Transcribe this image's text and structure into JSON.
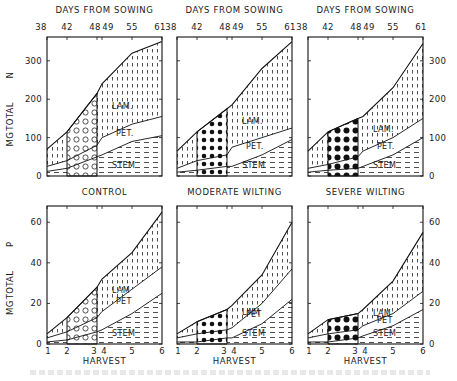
{
  "figure": {
    "top_axis_title": "DAYS FROM SOWING",
    "top_axis_ticks": [
      "38",
      "42",
      "48",
      "49",
      "55",
      "61"
    ],
    "bottom_axis_title": "HARVEST",
    "bottom_axis_ticks": [
      "1",
      "2",
      "3",
      "4",
      "5",
      "6"
    ],
    "top_ylabel": [
      "MG",
      "TOTAL",
      "N"
    ],
    "bottom_ylabel": [
      "MG",
      "TOTAL",
      "P"
    ],
    "top_yticks": [
      "0",
      "100",
      "200",
      "300"
    ],
    "bottom_yticks": [
      "0",
      "20",
      "40",
      "60"
    ],
    "panel_titles": [
      "CONTROL",
      "MODERATE WILTING",
      "SEVERE WILTING"
    ],
    "region_labels": {
      "lam": "LAM.",
      "pet": "PET.",
      "stem": "STEM",
      "lam_p": "LAM",
      "pet_p": "PET",
      "stem_p": "STEM"
    }
  },
  "chart_data": [
    {
      "type": "area",
      "title": "CONTROL",
      "xlabel": "DAYS FROM SOWING",
      "ylabel": "MG TOTAL N",
      "x": [
        38,
        42,
        48,
        49,
        55,
        61
      ],
      "ylim": [
        0,
        362
      ],
      "stacked": true,
      "series": [
        {
          "name": "STEM",
          "values": [
            12,
            20,
            50,
            55,
            90,
            105
          ]
        },
        {
          "name": "PET.",
          "values": [
            13,
            20,
            30,
            45,
            45,
            50
          ]
        },
        {
          "name": "LAM.",
          "values": [
            45,
            75,
            135,
            140,
            185,
            195
          ]
        }
      ],
      "cumulative_top": [
        70,
        115,
        215,
        240,
        320,
        350
      ],
      "highlight_interval": [
        42,
        48
      ]
    },
    {
      "type": "area",
      "title": "MODERATE WILTING",
      "xlabel": "DAYS FROM SOWING",
      "ylabel": "MG TOTAL N",
      "x": [
        38,
        42,
        48,
        49,
        55,
        61
      ],
      "ylim": [
        0,
        362
      ],
      "stacked": true,
      "series": [
        {
          "name": "STEM",
          "values": [
            10,
            15,
            25,
            25,
            55,
            95
          ]
        },
        {
          "name": "PET.",
          "values": [
            10,
            25,
            30,
            50,
            45,
            30
          ]
        },
        {
          "name": "LAM.",
          "values": [
            45,
            75,
            120,
            110,
            180,
            225
          ]
        }
      ],
      "cumulative_top": [
        65,
        115,
        175,
        185,
        280,
        350
      ],
      "highlight_interval": [
        42,
        48
      ]
    },
    {
      "type": "area",
      "title": "SEVERE WILTING",
      "xlabel": "DAYS FROM SOWING",
      "ylabel": "MG TOTAL N",
      "x": [
        38,
        42,
        48,
        49,
        55,
        61
      ],
      "ylim": [
        0,
        362
      ],
      "stacked": true,
      "series": [
        {
          "name": "STEM",
          "values": [
            10,
            15,
            20,
            25,
            55,
            100
          ]
        },
        {
          "name": "PET.",
          "values": [
            10,
            15,
            30,
            40,
            45,
            50
          ]
        },
        {
          "name": "LAM.",
          "values": [
            45,
            85,
            100,
            90,
            130,
            195
          ]
        }
      ],
      "cumulative_top": [
        65,
        115,
        150,
        155,
        230,
        345
      ],
      "highlight_interval": [
        42,
        48
      ]
    },
    {
      "type": "area",
      "title": "CONTROL",
      "xlabel": "HARVEST",
      "ylabel": "MG TOTAL P",
      "x": [
        1,
        2,
        3,
        4,
        5,
        6
      ],
      "ylim": [
        0,
        68
      ],
      "stacked": true,
      "series": [
        {
          "name": "STEM",
          "values": [
            1,
            2,
            6,
            7,
            15,
            25
          ]
        },
        {
          "name": "PET",
          "values": [
            2,
            4,
            7,
            9,
            12,
            13
          ]
        },
        {
          "name": "LAM",
          "values": [
            2,
            7,
            15,
            16,
            18,
            27
          ]
        }
      ],
      "cumulative_top": [
        5,
        13,
        28,
        32,
        45,
        65
      ],
      "highlight_interval": [
        2,
        3
      ]
    },
    {
      "type": "area",
      "title": "MODERATE WILTING",
      "xlabel": "HARVEST",
      "ylabel": "MG TOTAL P",
      "x": [
        1,
        2,
        3,
        4,
        5,
        6
      ],
      "ylim": [
        0,
        68
      ],
      "stacked": true,
      "series": [
        {
          "name": "STEM",
          "values": [
            1,
            1,
            3,
            3,
            10,
            22
          ]
        },
        {
          "name": "PET",
          "values": [
            2,
            4,
            4,
            5,
            10,
            15
          ]
        },
        {
          "name": "LAM",
          "values": [
            2,
            6,
            10,
            11,
            14,
            23
          ]
        }
      ],
      "cumulative_top": [
        5,
        11,
        17,
        19,
        34,
        60
      ],
      "highlight_interval": [
        2,
        3
      ]
    },
    {
      "type": "area",
      "title": "SEVERE WILTING",
      "xlabel": "HARVEST",
      "ylabel": "MG TOTAL P",
      "x": [
        1,
        2,
        3,
        4,
        5,
        6
      ],
      "ylim": [
        0,
        68
      ],
      "stacked": true,
      "series": [
        {
          "name": "STEM",
          "values": [
            1,
            1,
            3,
            4,
            9,
            17
          ]
        },
        {
          "name": "PET",
          "values": [
            2,
            4,
            4,
            5,
            6,
            9
          ]
        },
        {
          "name": "LAM",
          "values": [
            2,
            7,
            8,
            8,
            16,
            29
          ]
        }
      ],
      "cumulative_top": [
        5,
        12,
        15,
        17,
        31,
        55
      ],
      "highlight_interval": [
        2,
        3
      ]
    }
  ]
}
